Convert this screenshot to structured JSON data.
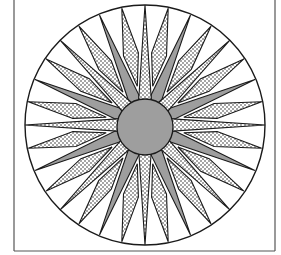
{
  "figure": {
    "title": "",
    "frame": {
      "left": 14,
      "right": 275,
      "bottom": 251,
      "top": null
    },
    "center": {
      "x": 145,
      "y": 125
    },
    "outer_radius": 120,
    "hub_radius": 28,
    "colors": {
      "line": "#1a1a1a",
      "gray": "#9e9e9e",
      "dot_bg": "#ffffff",
      "dot": "#222222",
      "white": "#ffffff"
    },
    "tiers": [
      {
        "name": "large-dotted-points",
        "count": 8,
        "start_angle": 0,
        "tip_r": 120,
        "base_r": 24,
        "half_width_deg": 15,
        "fill": "dots"
      },
      {
        "name": "gray-points",
        "count": 8,
        "start_angle": 22.5,
        "tip_r": 119,
        "base_r": 30,
        "half_width_deg": 11,
        "fill": "gray"
      },
      {
        "name": "small-dotted-points",
        "count": 16,
        "start_angle": 11.25,
        "tip_r": 119,
        "base_r": 72,
        "half_width_deg": 6,
        "fill": "dots"
      }
    ]
  }
}
